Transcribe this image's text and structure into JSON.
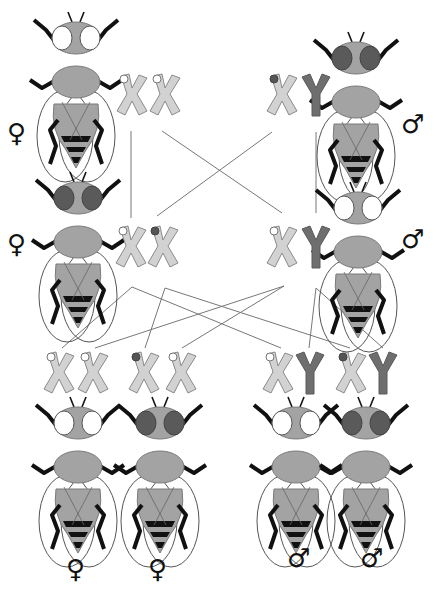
{
  "diagram": {
    "title": "",
    "colors": {
      "body": "#a3a3a3",
      "body_stroke": "#7a7a7a",
      "leg": "#111111",
      "wing_stroke": "#555555",
      "eye_white": "#ffffff",
      "eye_red": "#5a5a5a",
      "x_chromosome": "#d2d2d2",
      "x_stroke": "#8a8a8a",
      "y_chromosome": "#6e6e6e",
      "allele_white": "#ffffff",
      "allele_red": "#555555",
      "cross_line": "#777777"
    },
    "symbols": {
      "female": "♀",
      "male": "♂"
    },
    "parents": [
      {
        "id": "p-female-top",
        "sex": "female",
        "eye": "white",
        "genotype": [
          "X-white",
          "X-white"
        ],
        "fly": {
          "x": 73,
          "y": 12
        },
        "chrom": {
          "x": 117,
          "y": 74
        },
        "symbol": {
          "x": 8,
          "y": 120
        }
      },
      {
        "id": "p-male-top",
        "sex": "male",
        "eye": "red",
        "genotype": [
          "X-red",
          "Y"
        ],
        "fly": {
          "x": 356,
          "y": 34
        },
        "chrom": {
          "x": 266,
          "y": 74
        },
        "symbol": {
          "x": 402,
          "y": 114
        }
      },
      {
        "id": "f1-female",
        "sex": "female",
        "eye": "red",
        "genotype": [
          "X-white",
          "X-red"
        ],
        "fly": {
          "x": 78,
          "y": 172
        },
        "chrom": {
          "x": 117,
          "y": 226
        },
        "symbol": {
          "x": 8,
          "y": 232
        }
      },
      {
        "id": "f1-male",
        "sex": "male",
        "eye": "white",
        "genotype": [
          "X-white",
          "Y"
        ],
        "fly": {
          "x": 356,
          "y": 183
        },
        "chrom": {
          "x": 266,
          "y": 226
        },
        "symbol": {
          "x": 402,
          "y": 228
        }
      }
    ],
    "offspring": [
      {
        "id": "f2-female-white",
        "sex": "female",
        "eye": "white",
        "genotype": [
          "X-white",
          "X-white"
        ],
        "fly": {
          "x": 78,
          "y": 400
        },
        "chrom": {
          "x": 45,
          "y": 350
        },
        "symbol": {
          "x": 66,
          "y": 556
        }
      },
      {
        "id": "f2-female-red",
        "sex": "female",
        "eye": "red",
        "genotype": [
          "X-red",
          "X-white"
        ],
        "fly": {
          "x": 160,
          "y": 400
        },
        "chrom": {
          "x": 130,
          "y": 350
        },
        "symbol": {
          "x": 148,
          "y": 556
        }
      },
      {
        "id": "f2-male-white",
        "sex": "male",
        "eye": "white",
        "genotype": [
          "X-white",
          "Y"
        ],
        "fly": {
          "x": 296,
          "y": 400
        },
        "chrom": {
          "x": 262,
          "y": 350
        },
        "symbol": {
          "x": 288,
          "y": 548
        }
      },
      {
        "id": "f2-male-red",
        "sex": "male",
        "eye": "red",
        "genotype": [
          "X-red",
          "Y"
        ],
        "fly": {
          "x": 366,
          "y": 400
        },
        "chrom": {
          "x": 335,
          "y": 350
        },
        "symbol": {
          "x": 360,
          "y": 548
        }
      }
    ],
    "cross_lines": [
      [
        131,
        131,
        131,
        218
      ],
      [
        162,
        131,
        282,
        213
      ],
      [
        272,
        132,
        157,
        216
      ],
      [
        316,
        132,
        316,
        213
      ],
      [
        132,
        287,
        62,
        348
      ],
      [
        132,
        287,
        281,
        348
      ],
      [
        165,
        288,
        145,
        348
      ],
      [
        165,
        288,
        350,
        348
      ],
      [
        284,
        286,
        95,
        348
      ],
      [
        284,
        286,
        182,
        348
      ],
      [
        316,
        288,
        309,
        348
      ],
      [
        316,
        288,
        383,
        348
      ]
    ]
  }
}
